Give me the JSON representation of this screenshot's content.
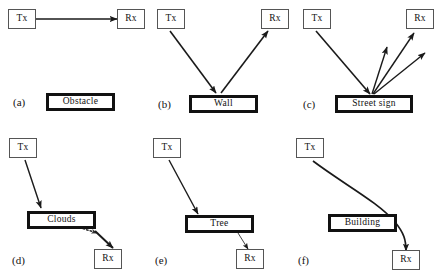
{
  "figure": {
    "background_color": "#ffffff",
    "line_color": "#1a1a1a",
    "node_border_color": "#555555",
    "object_border_color": "#111111",
    "panels": [
      {
        "id": "a",
        "label": "(a)",
        "mechanism": "blocking",
        "tx_label": "Tx",
        "rx_label": "Rx",
        "object_label": "Obstacle"
      },
      {
        "id": "b",
        "label": "(b)",
        "mechanism": "reflection",
        "tx_label": "Tx",
        "rx_label": "Rx",
        "object_label": "Wall"
      },
      {
        "id": "c",
        "label": "(c)",
        "mechanism": "scattering",
        "tx_label": "Tx",
        "rx_label": "Rx",
        "object_label": "Street sign"
      },
      {
        "id": "d",
        "label": "(d)",
        "mechanism": "attenuation",
        "tx_label": "Tx",
        "rx_label": "Rx",
        "object_label": "Clouds"
      },
      {
        "id": "e",
        "label": "(e)",
        "mechanism": "foliage-loss",
        "tx_label": "Tx",
        "rx_label": "Rx",
        "object_label": "Tree"
      },
      {
        "id": "f",
        "label": "(f)",
        "mechanism": "diffraction",
        "tx_label": "Tx",
        "rx_label": "Rx",
        "object_label": "Building"
      }
    ]
  }
}
